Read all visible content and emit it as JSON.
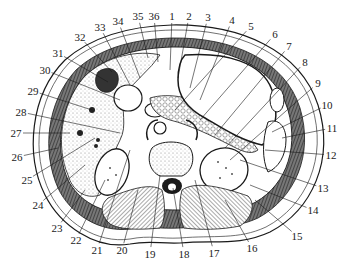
{
  "figure": {
    "type": "anatomical-cross-section",
    "view": "axial section of upper abdomen",
    "colors": {
      "ink": "#1a1a1a",
      "paper": "#ffffff",
      "stipple": "#d9d9d9",
      "muscle_hatch": "#555555",
      "dark_fill": "#333333"
    }
  },
  "labels": [
    {
      "n": "1",
      "x": 172,
      "y": 16,
      "tx": 170,
      "ty": 70
    },
    {
      "n": "2",
      "x": 189,
      "y": 16,
      "tx": 178,
      "ty": 78
    },
    {
      "n": "3",
      "x": 208,
      "y": 17,
      "tx": 190,
      "ty": 88
    },
    {
      "n": "4",
      "x": 232,
      "y": 20,
      "tx": 200,
      "ty": 100
    },
    {
      "n": "5",
      "x": 251,
      "y": 26,
      "tx": 175,
      "ty": 110
    },
    {
      "n": "6",
      "x": 275,
      "y": 34,
      "tx": 200,
      "ty": 120
    },
    {
      "n": "7",
      "x": 289,
      "y": 46,
      "tx": 215,
      "ty": 135
    },
    {
      "n": "8",
      "x": 305,
      "y": 62,
      "tx": 225,
      "ty": 148
    },
    {
      "n": "9",
      "x": 318,
      "y": 83,
      "tx": 230,
      "ty": 160
    },
    {
      "n": "10",
      "x": 327,
      "y": 105,
      "tx": 272,
      "ty": 132
    },
    {
      "n": "11",
      "x": 332,
      "y": 128,
      "tx": 282,
      "ty": 138
    },
    {
      "n": "12",
      "x": 331,
      "y": 155,
      "tx": 265,
      "ty": 150
    },
    {
      "n": "13",
      "x": 323,
      "y": 188,
      "tx": 240,
      "ty": 160
    },
    {
      "n": "14",
      "x": 313,
      "y": 210,
      "tx": 250,
      "ty": 185
    },
    {
      "n": "15",
      "x": 297,
      "y": 236,
      "tx": 255,
      "ty": 200
    },
    {
      "n": "16",
      "x": 252,
      "y": 248,
      "tx": 225,
      "ty": 200
    },
    {
      "n": "17",
      "x": 214,
      "y": 253,
      "tx": 195,
      "ty": 180
    },
    {
      "n": "18",
      "x": 184,
      "y": 254,
      "tx": 173,
      "ty": 188
    },
    {
      "n": "19",
      "x": 150,
      "y": 254,
      "tx": 160,
      "ty": 175
    },
    {
      "n": "20",
      "x": 122,
      "y": 250,
      "tx": 138,
      "ty": 190
    },
    {
      "n": "21",
      "x": 97,
      "y": 250,
      "tx": 130,
      "ty": 150
    },
    {
      "n": "22",
      "x": 76,
      "y": 240,
      "tx": 105,
      "ty": 180
    },
    {
      "n": "23",
      "x": 57,
      "y": 228,
      "tx": 85,
      "ty": 190
    },
    {
      "n": "24",
      "x": 38,
      "y": 205,
      "tx": 85,
      "ty": 165
    },
    {
      "n": "25",
      "x": 27,
      "y": 180,
      "tx": 95,
      "ty": 138
    },
    {
      "n": "26",
      "x": 17,
      "y": 157,
      "tx": 58,
      "ty": 148
    },
    {
      "n": "27",
      "x": 16,
      "y": 133,
      "tx": 70,
      "ty": 133
    },
    {
      "n": "28",
      "x": 21,
      "y": 112,
      "tx": 120,
      "ty": 133
    },
    {
      "n": "29",
      "x": 33,
      "y": 91,
      "tx": 92,
      "ty": 110
    },
    {
      "n": "30",
      "x": 45,
      "y": 70,
      "tx": 120,
      "ty": 100
    },
    {
      "n": "31",
      "x": 58,
      "y": 53,
      "tx": 108,
      "ty": 82
    },
    {
      "n": "32",
      "x": 80,
      "y": 37,
      "tx": 112,
      "ty": 72
    },
    {
      "n": "33",
      "x": 100,
      "y": 27,
      "tx": 130,
      "ty": 85
    },
    {
      "n": "34",
      "x": 118,
      "y": 21,
      "tx": 140,
      "ty": 78
    },
    {
      "n": "35",
      "x": 138,
      "y": 16,
      "tx": 148,
      "ty": 58
    },
    {
      "n": "36",
      "x": 154,
      "y": 16,
      "tx": 158,
      "ty": 62
    }
  ]
}
